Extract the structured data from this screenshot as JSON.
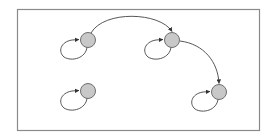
{
  "diagram": {
    "type": "state-graph",
    "frame": {
      "x": 17,
      "y": 9,
      "width": 242,
      "height": 121,
      "stroke": "#8a8a8a"
    },
    "node_style": {
      "radius": 7.5,
      "fill": "#c8c8c8",
      "stroke": "#6e6e6e"
    },
    "edge_style": {
      "stroke": "#444444"
    },
    "nodes": [
      {
        "id": "n1",
        "cx": 88,
        "cy": 40
      },
      {
        "id": "n2",
        "cx": 172,
        "cy": 40
      },
      {
        "id": "n3",
        "cx": 88,
        "cy": 91
      },
      {
        "id": "n4",
        "cx": 219,
        "cy": 92
      }
    ],
    "edges": [
      {
        "from": "n1",
        "to": "n1",
        "kind": "self-loop"
      },
      {
        "from": "n2",
        "to": "n2",
        "kind": "self-loop"
      },
      {
        "from": "n3",
        "to": "n3",
        "kind": "self-loop"
      },
      {
        "from": "n4",
        "to": "n4",
        "kind": "self-loop"
      },
      {
        "from": "n1",
        "to": "n2",
        "kind": "arc"
      },
      {
        "from": "n2",
        "to": "n4",
        "kind": "arc"
      }
    ]
  }
}
